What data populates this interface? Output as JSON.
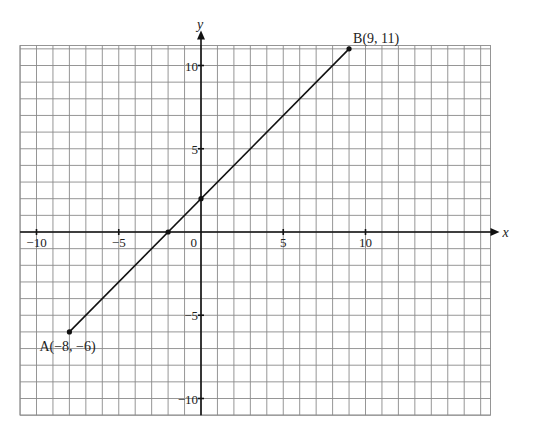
{
  "chart_data": {
    "type": "line",
    "title": "",
    "xlabel": "x",
    "ylabel": "y",
    "xlim": [
      -11,
      17.6
    ],
    "ylim": [
      -11,
      11.2
    ],
    "grid": true,
    "grid_step": 1,
    "x_ticks": [
      -10,
      -5,
      0,
      5,
      10
    ],
    "y_ticks": [
      10,
      5,
      -5,
      -10
    ],
    "x_tick_labels": [
      "−10",
      "−5",
      "0",
      "5",
      "10"
    ],
    "y_tick_labels": [
      "10",
      "5",
      "−5",
      "−10"
    ],
    "series": [
      {
        "name": "segment AB",
        "x": [
          -8,
          9
        ],
        "y": [
          -6,
          11
        ]
      }
    ],
    "points": [
      {
        "label": "A(−8, −6)",
        "x": -8,
        "y": -6
      },
      {
        "label": "B(9, 11)",
        "x": 9,
        "y": 11
      },
      {
        "label": "",
        "x": 0,
        "y": 2
      },
      {
        "label": "",
        "x": -2,
        "y": 0
      }
    ],
    "legend": null
  },
  "labels": {
    "x_axis": "x",
    "y_axis": "y",
    "point_a": "A(−8, −6)",
    "point_b": "B(9, 11)",
    "origin": "0"
  },
  "colors": {
    "grid": "#8a8a8a",
    "axis": "#111111",
    "line": "#111111",
    "background": "#ffffff"
  }
}
